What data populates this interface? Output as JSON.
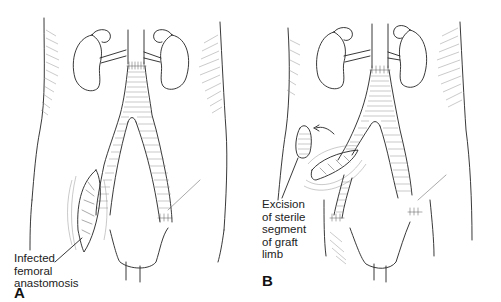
{
  "figure": {
    "panels": [
      {
        "letter": "A",
        "label_lines": [
          "Infected",
          "femoral",
          "anastomosis"
        ]
      },
      {
        "letter": "B",
        "label_lines": [
          "Excision",
          "of sterile",
          "segment",
          "of graft",
          "limb"
        ]
      }
    ]
  }
}
